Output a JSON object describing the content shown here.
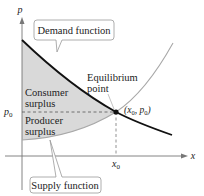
{
  "diagram": {
    "axes": {
      "y_label": "p",
      "x_label": "x"
    },
    "ticks": {
      "p0": "p",
      "p0_sub": "0",
      "x0": "x",
      "x0_sub": "0"
    },
    "callouts": {
      "demand": "Demand function",
      "supply": "Supply function"
    },
    "regions": {
      "consumer_line1": "Consumer",
      "consumer_line2": "surplus",
      "producer_line1": "Producer",
      "producer_line2": "surplus"
    },
    "equilibrium": {
      "label_line1": "Equilibrium",
      "label_line2": "point",
      "coord_open": "(x",
      "coord_sub1": "0",
      "coord_sep": ", p",
      "coord_sub2": "0",
      "coord_close": ")"
    },
    "colors": {
      "demand_curve": "#111111",
      "supply_curve": "#a8a8a8",
      "surplus_fill": "#d9d9d9",
      "axis": "#777777",
      "callout_border": "#999999"
    }
  }
}
